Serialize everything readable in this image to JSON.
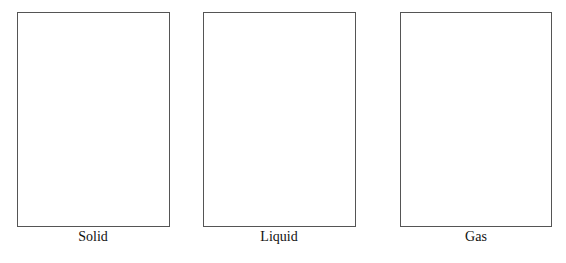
{
  "diagram": {
    "panels": [
      {
        "label": "Solid"
      },
      {
        "label": "Liquid"
      },
      {
        "label": "Gas"
      }
    ],
    "border_color": "#555555",
    "background": "#ffffff"
  }
}
